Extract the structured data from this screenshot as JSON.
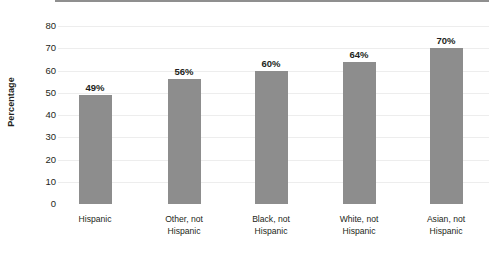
{
  "chart_data": {
    "type": "bar",
    "title": "",
    "subtitle": "",
    "xlabel": "",
    "ylabel": "Percentage",
    "categories": [
      "Hispanic",
      "Other, not\nHispanic",
      "Black, not\nHispanic",
      "White, not\nHispanic",
      "Asian, not\nHispanic"
    ],
    "values": [
      49,
      56,
      60,
      64,
      70
    ],
    "data_labels": [
      "49%",
      "56%",
      "60%",
      "64%",
      "70%"
    ],
    "ylim": [
      0,
      80
    ],
    "ytick_labels": [
      "80",
      "70",
      "60",
      "50",
      "40",
      "30",
      "20",
      "10",
      "0"
    ],
    "ytick_values": [
      80,
      70,
      60,
      50,
      40,
      30,
      20,
      10,
      0
    ],
    "grid": true,
    "legend": "none",
    "legend_position": "none",
    "colors": {
      "bar": "#8d8d8d",
      "gridline": "#ededed",
      "baseline": "#8f8f8f",
      "text": "#231f20",
      "background": "#ffffff"
    }
  }
}
